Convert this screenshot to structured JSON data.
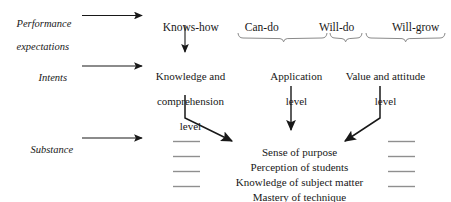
{
  "figure": {
    "row_labels": [
      {
        "id": "performance-expectations",
        "line1": "Performance",
        "line2": "expectations"
      },
      {
        "id": "intents",
        "line1": "Intents",
        "line2": ""
      },
      {
        "id": "substance",
        "line1": "Substance",
        "line2": ""
      }
    ],
    "column_headers": [
      {
        "id": "knows-how",
        "label": "Knows-how"
      },
      {
        "id": "can-do",
        "label": "Can-do"
      },
      {
        "id": "will-do",
        "label": "Will-do"
      },
      {
        "id": "will-grow",
        "label": "Will-grow"
      }
    ],
    "intent_nodes": [
      {
        "id": "knowledge-comprehension-level",
        "line1": "Knowledge and",
        "line2": "comprehension",
        "line3": "level"
      },
      {
        "id": "application-level",
        "line1": "Application",
        "line2": "level",
        "line3": ""
      },
      {
        "id": "value-attitude-level",
        "line1": "Value and attitude",
        "line2": "level",
        "line3": ""
      }
    ],
    "substance_items": [
      {
        "id": "sense-of-purpose",
        "label": "Sense of purpose"
      },
      {
        "id": "perception-of-students",
        "label": "Perception of students"
      },
      {
        "id": "knowledge-of-subject-matter",
        "label": "Knowledge of subject matter"
      },
      {
        "id": "mastery-of-technique",
        "label": "Mastery of technique"
      }
    ],
    "colors": {
      "ink": "#181818",
      "rule": "#8f8f8f",
      "brace": "#7d7d7d",
      "background": "#ffffff"
    }
  }
}
